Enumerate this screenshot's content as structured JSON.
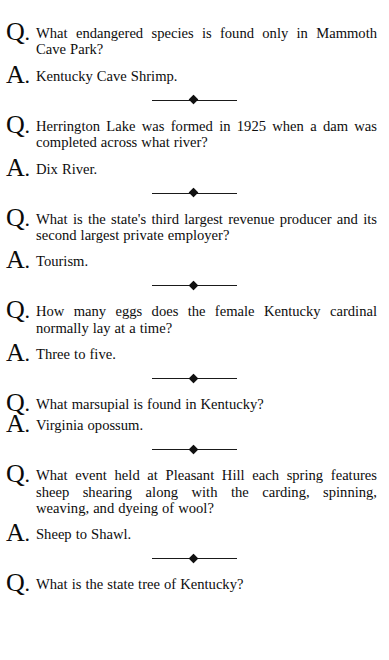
{
  "page": {
    "background_color": "#ffffff",
    "text_color": "#111111",
    "question_marker": "Q",
    "answer_marker": "A",
    "marker_punctuation": ".",
    "divider_icon": "diamond-rule-ornament"
  },
  "entries": [
    {
      "question": "What endangered species is found only in Mammoth Cave Park?",
      "answer": "Kentucky Cave Shrimp.",
      "lines": 2
    },
    {
      "question": "Herrington Lake was formed in 1925 when a dam was completed across what river?",
      "answer": "Dix River.",
      "lines": 2
    },
    {
      "question": "What is the state's third largest revenue producer and its second largest private employer?",
      "answer": "Tourism.",
      "lines": 2
    },
    {
      "question": "How many eggs does the female Kentucky cardinal normally lay at a time?",
      "answer": "Three to five.",
      "lines": 2
    },
    {
      "question": "What marsupial is found in Kentucky?",
      "answer": "Virginia opossum.",
      "lines": 1
    },
    {
      "question": "What event held at Pleasant Hill each spring features sheep shearing along with the carding, spinning, weaving, and dyeing of wool?",
      "answer": "Sheep to Shawl.",
      "lines": 3
    },
    {
      "question": "What is the state tree of Kentucky?",
      "answer": "",
      "lines": 1,
      "clipped": true
    }
  ]
}
